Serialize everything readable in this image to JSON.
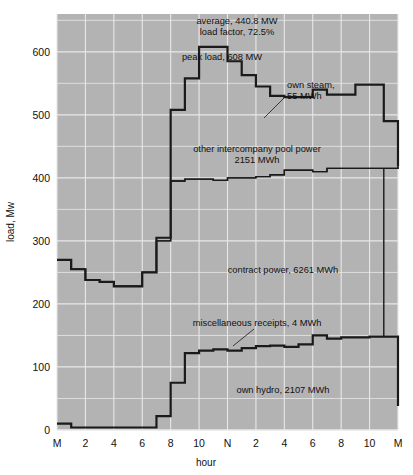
{
  "figure": {
    "name": "daily-load-curve",
    "background": "#ffffff",
    "plot_background": "#b3b3b3",
    "grid_color": "#e8e8e8",
    "line_color": "#1a1a1a"
  },
  "chart_data": {
    "type": "area",
    "title": "",
    "subtitle": "",
    "xlabel": "hour",
    "ylabel": "load, Mw",
    "xlim": [
      0,
      24
    ],
    "ylim": [
      0,
      660
    ],
    "grid": true,
    "legend_position": "inline-annotations",
    "x_tick_values": [
      0,
      2,
      4,
      6,
      8,
      10,
      12,
      14,
      16,
      18,
      20,
      22,
      24
    ],
    "x_tick_labels": [
      "M",
      "2",
      "4",
      "6",
      "8",
      "10",
      "N",
      "2",
      "4",
      "6",
      "8",
      "10",
      "M"
    ],
    "y_tick_values": [
      0,
      100,
      200,
      300,
      400,
      500,
      600
    ],
    "y_tick_labels": [
      "0",
      "100",
      "200",
      "300",
      "400",
      "500",
      "600"
    ],
    "step_style": "post",
    "hours": [
      0,
      1,
      2,
      3,
      4,
      5,
      6,
      7,
      8,
      9,
      10,
      11,
      12,
      13,
      14,
      15,
      16,
      17,
      18,
      19,
      20,
      21,
      22,
      23,
      24
    ],
    "series": [
      {
        "name": "total load (top of own steam band)",
        "band_label": "own steam, 55 MWh",
        "band_total_mwh": 55,
        "values": [
          270,
          255,
          238,
          235,
          228,
          228,
          250,
          305,
          508,
          558,
          608,
          608,
          585,
          563,
          545,
          530,
          528,
          528,
          540,
          532,
          532,
          548,
          548,
          490,
          418
        ]
      },
      {
        "name": "cumulative: hydro + contract + pool (top of other intercompany pool power band)",
        "band_label": "other intercompany pool power 2151 MWh",
        "band_total_mwh": 2151,
        "values": [
          270,
          255,
          238,
          235,
          228,
          228,
          250,
          300,
          395,
          398,
          398,
          396,
          400,
          400,
          402,
          405,
          412,
          412,
          410,
          415,
          415,
          415,
          415,
          415,
          418
        ]
      },
      {
        "name": "cumulative: hydro + contract (top of contract power band)",
        "band_label": "contract power, 6261 MWh",
        "band_total_mwh": 6261,
        "values": [
          270,
          255,
          238,
          235,
          228,
          228,
          250,
          300,
          395,
          398,
          398,
          396,
          400,
          400,
          402,
          405,
          412,
          412,
          410,
          415,
          415,
          415,
          415,
          415,
          418
        ]
      },
      {
        "name": "own hydro + miscellaneous receipts (top of own hydro band)",
        "band_label": "own hydro, 2107 MWh",
        "band_total_mwh": 2107,
        "misc_label": "miscellaneous receipts, 4 MWh",
        "misc_total_mwh": 4,
        "values": [
          10,
          4,
          4,
          4,
          4,
          4,
          4,
          22,
          75,
          122,
          126,
          128,
          126,
          130,
          133,
          134,
          132,
          136,
          150,
          145,
          147,
          147,
          148,
          148,
          38,
          33
        ]
      }
    ],
    "annotations": [
      {
        "id": "average",
        "text": "average, 440.8 MW",
        "value": 440.8,
        "unit": "MW"
      },
      {
        "id": "load-factor",
        "text": "load factor, 72.5%",
        "value": 72.5,
        "unit": "%"
      },
      {
        "id": "peak-load",
        "text": "peak load, 608 MW",
        "value": 608,
        "unit": "MW"
      },
      {
        "id": "own-steam-1",
        "text": "own steam,",
        "value": 55,
        "unit": "MWh"
      },
      {
        "id": "own-steam-2",
        "text": "55 MWh",
        "value": 55,
        "unit": "MWh"
      },
      {
        "id": "pool-power-1",
        "text": "other intercompany pool power",
        "value": 2151,
        "unit": "MWh"
      },
      {
        "id": "pool-power-2",
        "text": "2151 MWh",
        "value": 2151,
        "unit": "MWh"
      },
      {
        "id": "contract-power",
        "text": "contract power, 6261 MWh",
        "value": 6261,
        "unit": "MWh"
      },
      {
        "id": "misc-receipts",
        "text": "miscellaneous receipts, 4 MWh",
        "value": 4,
        "unit": "MWh"
      },
      {
        "id": "own-hydro",
        "text": "own hydro, 2107 MWh",
        "value": 2107,
        "unit": "MWh"
      }
    ]
  },
  "axis": {
    "x_title": "hour",
    "y_title": "load, Mw",
    "x_labels": [
      "M",
      "2",
      "4",
      "6",
      "8",
      "10",
      "N",
      "2",
      "4",
      "6",
      "8",
      "10",
      "M"
    ],
    "y_labels": [
      "0",
      "100",
      "200",
      "300",
      "400",
      "500",
      "600"
    ]
  },
  "annotations_text": {
    "average": "average, 440.8 MW",
    "load_factor": "load factor, 72.5%",
    "peak_load": "peak load, 608 MW",
    "own_steam_line1": "own steam,",
    "own_steam_line2": "55 MWh",
    "pool_power_line1": "other intercompany pool power",
    "pool_power_line2": "2151 MWh",
    "contract_power": "contract power, 6261 MWh",
    "misc_receipts": "miscellaneous receipts, 4 MWh",
    "own_hydro": "own hydro, 2107 MWh"
  }
}
